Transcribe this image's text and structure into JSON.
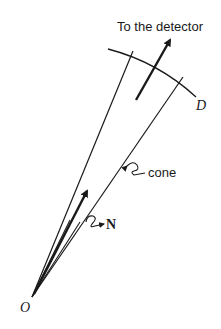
{
  "diagram": {
    "labels": {
      "detector": "To the detector",
      "surface": "D",
      "cone": "cone",
      "normal": "N",
      "origin": "O"
    },
    "colors": {
      "stroke": "#1a1a1a",
      "background": "#ffffff"
    }
  }
}
